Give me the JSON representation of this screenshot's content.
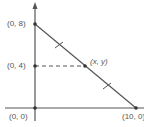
{
  "diagram": {
    "type": "coordinate-geometry",
    "colors": {
      "line": "#555555",
      "text": "#555555",
      "background": "#ffffff"
    },
    "points": {
      "top": "(0, 8)",
      "mid_y": "(0, 4)",
      "generic": "(x, y)",
      "origin": "(0, 0)",
      "right": "(10, 0)"
    },
    "segments": [
      {
        "from": "(0, 8)",
        "to": "(10, 0)",
        "style": "solid",
        "tick_marks": 2
      },
      {
        "from": "(0, 4)",
        "to": "(x, y)",
        "style": "dashed"
      }
    ],
    "axes": {
      "x_axis": "horizontal",
      "y_axis": "vertical with arrow"
    }
  }
}
